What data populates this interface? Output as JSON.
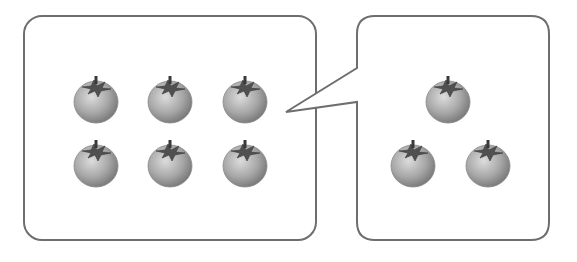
{
  "diagram": {
    "left_panel": {
      "tomato_count": 6,
      "arrangement": "2 rows x 3 columns",
      "tomatoes": [
        {
          "cx": 96,
          "cy": 100
        },
        {
          "cx": 170,
          "cy": 100
        },
        {
          "cx": 245,
          "cy": 100
        },
        {
          "cx": 96,
          "cy": 164
        },
        {
          "cx": 170,
          "cy": 164
        },
        {
          "cx": 245,
          "cy": 164
        }
      ]
    },
    "right_panel": {
      "tomato_count": 3,
      "arrangement": "triangle",
      "tomatoes": [
        {
          "cx": 448,
          "cy": 100
        },
        {
          "cx": 413,
          "cy": 164
        },
        {
          "cx": 488,
          "cy": 164
        }
      ]
    },
    "colors": {
      "border": "#6e6e6e",
      "fruit_light": "#d9d9d9",
      "fruit_dark": "#7a7a7a",
      "leaf": "#4a4a4a"
    }
  }
}
